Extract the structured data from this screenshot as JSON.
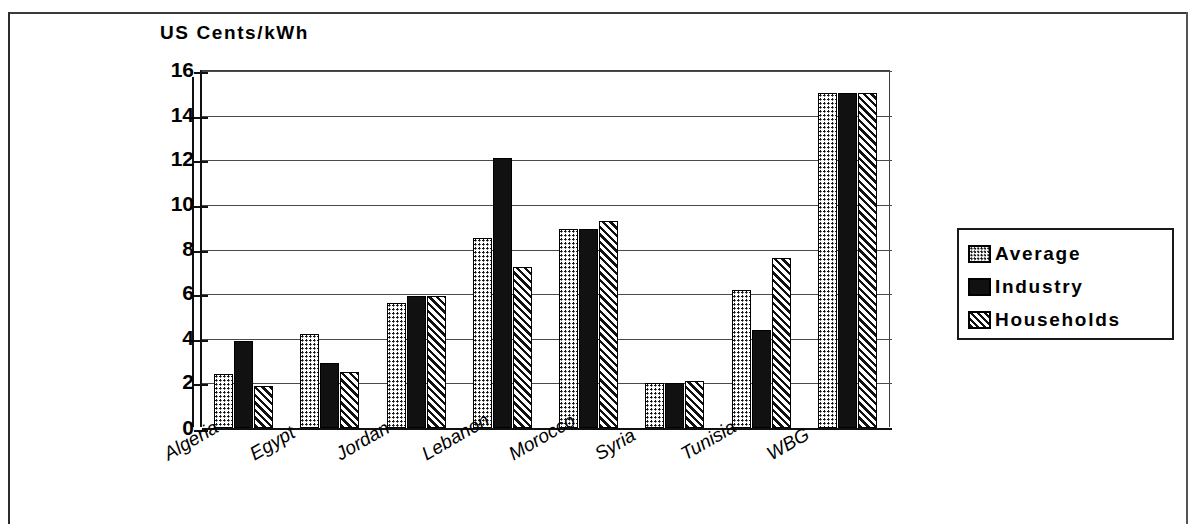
{
  "chart_data": {
    "type": "bar",
    "title": "US Cents/kWh",
    "xlabel": "",
    "ylabel": "US Cents/kWh",
    "ylim": [
      0,
      16
    ],
    "yticks": [
      "0",
      "2",
      "4",
      "6",
      "8",
      "10",
      "12",
      "14",
      "16"
    ],
    "grid": true,
    "legend_position": "right",
    "categories": [
      "Algeria",
      "Egypt",
      "Jordan",
      "Lebanon",
      "Morocco",
      "Syria",
      "Tunisia",
      "WBG"
    ],
    "series": [
      {
        "name": "Average",
        "pattern": "dotted-checker",
        "values": [
          2.4,
          4.2,
          5.6,
          8.5,
          8.9,
          2.0,
          6.2,
          15.0
        ]
      },
      {
        "name": "Industry",
        "pattern": "solid-black",
        "values": [
          3.9,
          2.9,
          5.9,
          12.1,
          8.9,
          2.0,
          4.4,
          15.0
        ]
      },
      {
        "name": "Households",
        "pattern": "diagonal-hatch",
        "values": [
          1.9,
          2.5,
          5.9,
          7.2,
          9.3,
          2.1,
          7.6,
          15.0
        ]
      }
    ]
  },
  "legend": {
    "items": [
      {
        "label": "Average",
        "swatch": "avg"
      },
      {
        "label": "Industry",
        "swatch": "ind"
      },
      {
        "label": "Households",
        "swatch": "hh"
      }
    ]
  },
  "colors": {
    "ink": "#111111",
    "paper": "#ffffff",
    "grid": "#4a4a4a"
  }
}
